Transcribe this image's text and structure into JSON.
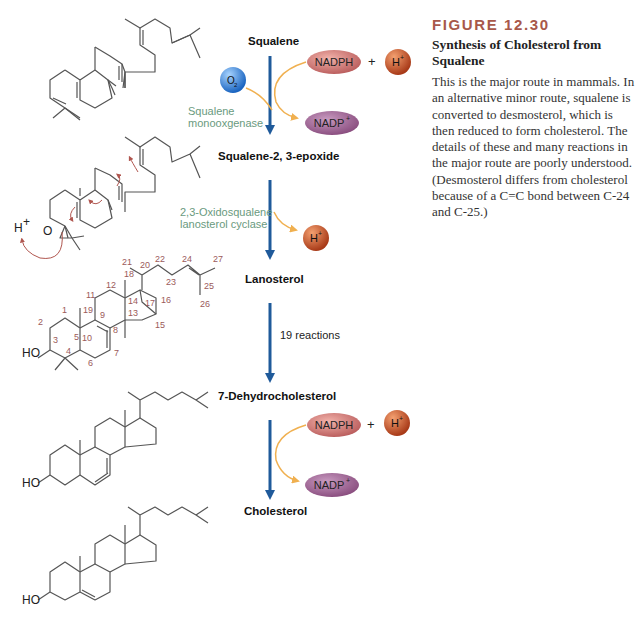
{
  "caption": {
    "figure_number": "FIGURE 12.30",
    "title": "Synthesis of Cholesterol from Squalene",
    "body": "This is the major route in mammals. In an alternative minor route, squalene is converted to desmosterol, which is then reduced to form cholesterol. The details of these and many reactions in the major route are poorly understood. (Desmosterol differs from cholesterol because of a C=C bond between C-24 and C-25.)"
  },
  "compounds": {
    "squalene": "Squalene",
    "epoxide": "Squalene-2, 3-epoxide",
    "lanosterol": "Lanosterol",
    "dehydrocholesterol": "7-Dehydrocholesterol",
    "cholesterol": "Cholesterol"
  },
  "steps": {
    "step1": {
      "enzyme_line1": "Squalene",
      "enzyme_line2": "monooxgenase"
    },
    "step2": {
      "enzyme_line1": "2,3-Oxidosqualene",
      "enzyme_line2": "lanosterol cyclase"
    },
    "step3": {
      "note": "19 reactions"
    }
  },
  "cofactors": {
    "o2": "O",
    "o2_sub": "2",
    "nadph": "NADPH",
    "nadp": "NADP",
    "nadp_sup": "+",
    "h": "H",
    "h_sup": "+",
    "plus": "+"
  },
  "atoms": {
    "ho": "HO",
    "o": "O",
    "h": "H",
    "h_sup": "+"
  },
  "lanosterol_numbers": [
    "1",
    "2",
    "3",
    "4",
    "5",
    "6",
    "7",
    "8",
    "9",
    "10",
    "11",
    "12",
    "13",
    "14",
    "15",
    "16",
    "17",
    "18",
    "19",
    "20",
    "21",
    "22",
    "23",
    "24",
    "25",
    "26",
    "27"
  ],
  "colors": {
    "main_arrow": "#1f5a9a",
    "side_arrow": "#f0b050",
    "nadph": "#c9706e",
    "nadp": "#9c5a8e",
    "proton": "#c0502a",
    "oxygen": "#3a8ad8",
    "enzyme_text": "#6a9a7e",
    "figure_number": "#a8584a"
  }
}
